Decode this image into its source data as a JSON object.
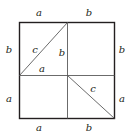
{
  "figure": {
    "type": "geometric-diagram",
    "colors": {
      "stroke": "#231f20",
      "inner_stroke": "#5a5a5a",
      "background": "#ffffff",
      "text": "#231f20"
    },
    "square": {
      "x": 19,
      "y": 22,
      "width": 95,
      "height": 96,
      "center_x": 67,
      "center_y": 75
    },
    "lines": {
      "vertical_divider": {
        "x1": 67,
        "y1": 22,
        "x2": 67,
        "y2": 118
      },
      "horizontal_divider": {
        "x1": 19,
        "y1": 75,
        "x2": 114,
        "y2": 75
      },
      "hypotenuse_upper_left": {
        "x1": 19,
        "y1": 75,
        "x2": 67,
        "y2": 22
      },
      "hypotenuse_lower_right": {
        "x1": 67,
        "y1": 75,
        "x2": 114,
        "y2": 118
      }
    },
    "labels": [
      {
        "id": "top-left-a",
        "text": "a",
        "x": 39,
        "y": 13
      },
      {
        "id": "top-right-b",
        "text": "b",
        "x": 89,
        "y": 13
      },
      {
        "id": "left-upper-b",
        "text": "b",
        "x": 9,
        "y": 50
      },
      {
        "id": "left-lower-a",
        "text": "a",
        "x": 9,
        "y": 99
      },
      {
        "id": "right-upper-b",
        "text": "b",
        "x": 122,
        "y": 50
      },
      {
        "id": "right-lower-a",
        "text": "a",
        "x": 122,
        "y": 99
      },
      {
        "id": "bottom-left-a",
        "text": "a",
        "x": 39,
        "y": 128
      },
      {
        "id": "bottom-right-b",
        "text": "b",
        "x": 89,
        "y": 128
      },
      {
        "id": "inner-c-upper",
        "text": "c",
        "x": 35,
        "y": 50
      },
      {
        "id": "inner-b-upper",
        "text": "b",
        "x": 62,
        "y": 53
      },
      {
        "id": "inner-a-middle",
        "text": "a",
        "x": 42,
        "y": 69
      },
      {
        "id": "inner-c-lower",
        "text": "c",
        "x": 93,
        "y": 89
      }
    ]
  },
  "chart_data": {
    "type": "diagram",
    "edge_labels": {
      "top": [
        "a",
        "b"
      ],
      "bottom": [
        "a",
        "b"
      ],
      "left": [
        "b",
        "a"
      ],
      "right": [
        "b",
        "a"
      ]
    },
    "interior_labels": [
      "c",
      "b",
      "a",
      "c"
    ],
    "symbols": [
      "a",
      "b",
      "c"
    ]
  }
}
